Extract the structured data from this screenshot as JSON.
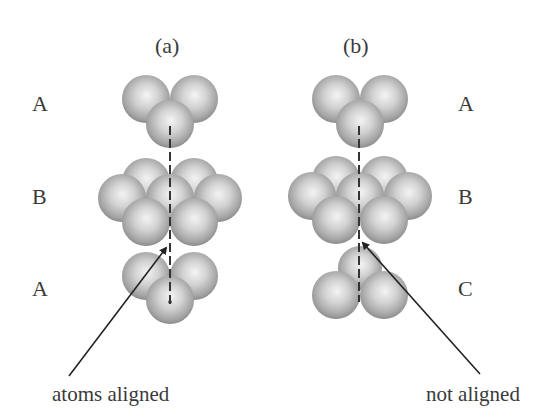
{
  "panels": [
    {
      "id": "a",
      "label": "(a)",
      "layers": [
        "A",
        "B",
        "A"
      ],
      "caption": "atoms aligned",
      "stacking": "ABA (hexagonal close-packed)"
    },
    {
      "id": "b",
      "label": "(b)",
      "layers": [
        "A",
        "B",
        "C"
      ],
      "caption": "not aligned",
      "stacking": "ABC (cubic close-packed)"
    }
  ],
  "colors": {
    "sphere_light": "#f2f2f2",
    "sphere_mid": "#b8b8b8",
    "sphere_dark": "#8a8a8a",
    "line": "#333333",
    "text": "#3a3a3a",
    "background": "#ffffff"
  }
}
